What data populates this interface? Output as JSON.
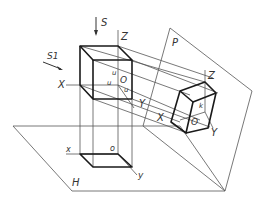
{
  "diagram": {
    "type": "axonometric-projection-illustration",
    "labels": {
      "direction_s": "S",
      "direction_s1": "S1",
      "plane_p": "P",
      "plane_h": "H",
      "cube_axis_z": "Z",
      "cube_axis_x": "X",
      "cube_axis_y": "Y",
      "cube_origin": "O",
      "cube_u1": "u",
      "cube_u2": "u",
      "cube_u3": "u",
      "proj_axis_z": "Z",
      "proj_axis_x": "X",
      "proj_axis_y": "Y",
      "proj_origin": "O",
      "proj_k": "k",
      "plan_axis_x": "x",
      "plan_axis_y": "y",
      "plan_origin": "o"
    },
    "colors": {
      "line": "#555555",
      "bold": "#1a1a1a",
      "background": "#ffffff"
    }
  }
}
